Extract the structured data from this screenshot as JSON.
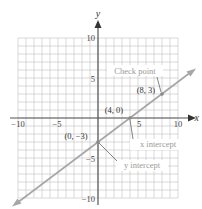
{
  "chart_data": {
    "type": "line",
    "title": "",
    "xlabel": "x",
    "ylabel": "y",
    "xlim": [
      -10,
      10
    ],
    "ylim": [
      -10,
      10
    ],
    "grid": true,
    "grid_step": 1,
    "x_ticks": [
      {
        "value": -10,
        "label": "−10"
      },
      {
        "value": -5,
        "label": "−5"
      },
      {
        "value": 5,
        "label": "5"
      },
      {
        "value": 10,
        "label": "10"
      }
    ],
    "y_ticks": [
      {
        "value": 10,
        "label": "10"
      },
      {
        "value": 5,
        "label": "5"
      },
      {
        "value": -5,
        "label": "−5"
      },
      {
        "value": -10,
        "label": "−10"
      }
    ],
    "series": [
      {
        "name": "y = (3/4)x − 3",
        "slope": 0.75,
        "intercept": -3,
        "x_range": [
          -10.5,
          12
        ],
        "arrows": "both",
        "color": "#a6a6a6"
      }
    ],
    "points": [
      {
        "x": 0,
        "y": -3,
        "label": "(0, −3)",
        "annotation": "y intercept"
      },
      {
        "x": 4,
        "y": 0,
        "label": "(4, 0)",
        "annotation": "x intercept"
      },
      {
        "x": 8,
        "y": 3,
        "label": "(8, 3)",
        "annotation": "Check point"
      }
    ],
    "annotations": [
      "Check point",
      "x intercept",
      "y intercept"
    ]
  },
  "labels": {
    "x_axis": "x",
    "y_axis": "y",
    "x_tick_neg10": "−10",
    "x_tick_neg5": "−5",
    "x_tick_5": "5",
    "x_tick_10": "10",
    "y_tick_10": "10",
    "y_tick_5": "5",
    "y_tick_neg5": "−5",
    "y_tick_neg10": "−10",
    "point_y_intercept": "(0, −3)",
    "point_x_intercept": "(4, 0)",
    "point_check": "(8, 3)",
    "callout_check": "Check point",
    "callout_x_intercept": "x intercept",
    "callout_y_intercept": "y intercept"
  },
  "colors": {
    "grid": "#c8c8c8",
    "axis": "#555555",
    "line": "#a6a6a6",
    "text": "#333333",
    "callout_text": "#9a9a9a"
  }
}
